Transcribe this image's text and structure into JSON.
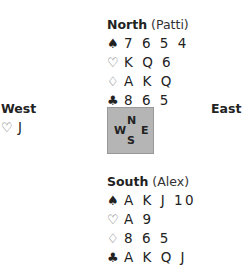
{
  "hands": {
    "north": {
      "seat": "North",
      "player": "(Patti)",
      "suits": [
        {
          "icon": "♠",
          "name": "spade",
          "cards": "7654"
        },
        {
          "icon": "♡",
          "name": "heart",
          "cards": "KQ6"
        },
        {
          "icon": "♢",
          "name": "diamond",
          "cards": "AKQ"
        },
        {
          "icon": "♣",
          "name": "club",
          "cards": "865"
        }
      ]
    },
    "west": {
      "seat": "West",
      "suits": [
        {
          "icon": "♡",
          "name": "heart",
          "cards": "J"
        }
      ]
    },
    "east": {
      "seat": "East"
    },
    "south": {
      "seat": "South",
      "player": "(Alex)",
      "suits": [
        {
          "icon": "♠",
          "name": "spade",
          "cards": "AKJ10"
        },
        {
          "icon": "♡",
          "name": "heart",
          "cards": "A9"
        },
        {
          "icon": "♢",
          "name": "diamond",
          "cards": "865"
        },
        {
          "icon": "♣",
          "name": "club",
          "cards": "AKQJ"
        }
      ]
    }
  },
  "compass": {
    "n": "N",
    "w": "W",
    "e": "E",
    "s": "S"
  }
}
